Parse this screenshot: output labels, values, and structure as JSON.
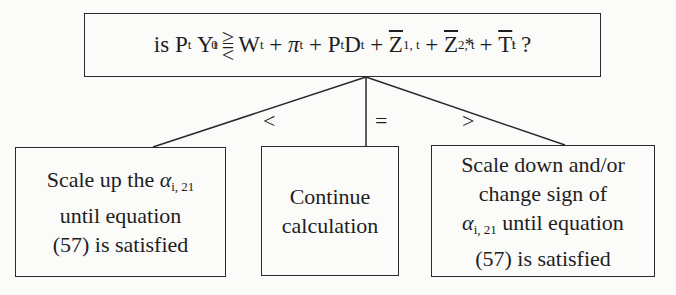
{
  "question": {
    "prefix": "is ",
    "P": "P",
    "P_sub": "t",
    "Y": "Y",
    "Y_sub": "t",
    "Y_sup": "0",
    "rel_top": ">",
    "rel_mid": "=",
    "rel_bot": "<",
    "W": "W",
    "W_sub": "t",
    "pi": "π",
    "pi_sub": "t",
    "PD_P": "P",
    "PD_P_sub": "t",
    "PD_D": "D",
    "PD_D_sub": "t",
    "Z1": "Z",
    "Z1_sub": "1, t",
    "Z2": "Z",
    "Z2_sub": "2, t",
    "Z2_sup": "*",
    "T": "T",
    "T_sub": "t",
    "T_sup": "!",
    "plus": "+",
    "suffix": "?"
  },
  "branches": [
    {
      "label": "<"
    },
    {
      "label": "="
    },
    {
      "label": ">"
    }
  ],
  "outcomes": {
    "less": {
      "line1_text": "Scale up the ",
      "alpha": "α",
      "alpha_sub": "i, 21",
      "line2": "until equation",
      "line3": "(57) is satisfied"
    },
    "equal": {
      "line1": "Continue",
      "line2": "calculation"
    },
    "greater": {
      "line1": "Scale down and/or",
      "line2": "change sign of",
      "alpha": "α",
      "alpha_sub": "i, 21",
      "line3_text": " until equation",
      "line4": "(57) is satisfied"
    }
  }
}
